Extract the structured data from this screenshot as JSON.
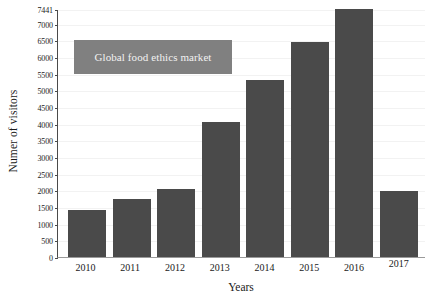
{
  "chart_data": {
    "type": "bar",
    "title": "",
    "xlabel": "Years",
    "ylabel": "Numer of visitors",
    "legend": [
      "Global food ethics market"
    ],
    "legend_position": "inside-top-left",
    "grid": true,
    "ylim": [
      0,
      7441
    ],
    "categories": [
      "2010",
      "2011",
      "2012",
      "2013",
      "2014",
      "2015",
      "2016",
      "2017"
    ],
    "values": [
      1400,
      1750,
      2050,
      4050,
      5300,
      6450,
      7441,
      1980
    ],
    "yticks": [
      0,
      500,
      1000,
      1500,
      2000,
      2500,
      3000,
      3500,
      4000,
      4500,
      5000,
      5500,
      6000,
      6500,
      7000,
      7441
    ],
    "ytick_labels": [
      "0",
      "500",
      "1000",
      "1500",
      "2000",
      "2500",
      "3000",
      "3500",
      "4000",
      "4500",
      "5000",
      "5500",
      "6000",
      "6500",
      "7000",
      "7441"
    ],
    "series": [
      {
        "name": "Global food ethics market",
        "values": [
          1400,
          1750,
          2050,
          4050,
          5300,
          6450,
          7441,
          1980
        ]
      }
    ],
    "colors": {
      "bar": "#4a4a4a",
      "legend_box": "#808080",
      "legend_text": "#f2f2f2",
      "axis": "#4a4a4a",
      "grid": "#f2f2f2",
      "background": "#ffffff"
    }
  }
}
